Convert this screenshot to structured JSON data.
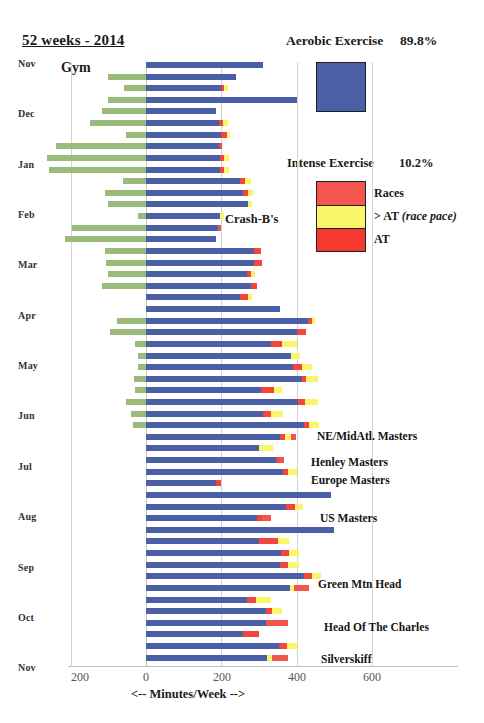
{
  "header": {
    "title": "52 weeks - 2014",
    "aerobic_label": "Aerobic Exercise",
    "aerobic_pct": "89.8%",
    "intense_label": "Intense Exercise",
    "intense_pct": "10.2%",
    "gym_label": "Gym",
    "crashb_label": "Crash-B's"
  },
  "legend": {
    "aerobic_swatch_color": "#4a5fa5",
    "items": [
      {
        "label": "Races",
        "color": "#f4554e"
      },
      {
        "label": "> AT (race pace)",
        "color": "#fbf56a"
      },
      {
        "label": "AT",
        "color": "#f4392e"
      }
    ]
  },
  "axis": {
    "x_title": "<--  Minutes/Week -->",
    "ticks": [
      "200",
      "0",
      "200",
      "400",
      "600"
    ],
    "tick_x_px": [
      80,
      146,
      222,
      297,
      372
    ],
    "months": [
      "Nov",
      "Dec",
      "Jan",
      "Feb",
      "Mar",
      "Apr",
      "May",
      "Jun",
      "Jul",
      "Aug",
      "Sep",
      "Oct",
      "Nov"
    ]
  },
  "annotations": [
    {
      "label": "NE/MidAtl. Masters",
      "top": 430,
      "left": 317
    },
    {
      "label": "Henley Masters",
      "top": 456,
      "left": 311
    },
    {
      "label": "Europe Masters",
      "top": 474,
      "left": 311
    },
    {
      "label": "US Masters",
      "top": 512,
      "left": 320
    },
    {
      "label": "Green Mtn Head",
      "top": 578,
      "left": 318
    },
    {
      "label": "Head Of The Charles",
      "top": 621,
      "left": 324
    },
    {
      "label": "Silverskiff",
      "top": 653,
      "left": 321
    }
  ],
  "chart_data": {
    "type": "bar",
    "title": "52 weeks - 2014",
    "xlabel": "<--  Minutes/Week -->",
    "ylabel": "",
    "xlim": [
      -260,
      620
    ],
    "grid": true,
    "orientation": "horizontal",
    "stacked": true,
    "legend_position": "right",
    "series_names": [
      "Gym",
      "Aerobic",
      "AT",
      "> AT (race pace)",
      "Races"
    ],
    "series_colors": [
      "#9bbb7b",
      "#4a5fa5",
      "#f4453a",
      "#fbf56a",
      "#f2554b"
    ],
    "categories": [
      "Week 1",
      "Week 2",
      "Week 3",
      "Week 4",
      "Week 5",
      "Week 6",
      "Week 7",
      "Week 8",
      "Week 9",
      "Week 10",
      "Week 11",
      "Week 12",
      "Week 13",
      "Week 14",
      "Week 15",
      "Week 16",
      "Week 17",
      "Week 18",
      "Week 19",
      "Week 20",
      "Week 21",
      "Week 22",
      "Week 23",
      "Week 24",
      "Week 25",
      "Week 26",
      "Week 27",
      "Week 28",
      "Week 29",
      "Week 30",
      "Week 31",
      "Week 32",
      "Week 33",
      "Week 34",
      "Week 35",
      "Week 36",
      "Week 37",
      "Week 38",
      "Week 39",
      "Week 40",
      "Week 41",
      "Week 42",
      "Week 43",
      "Week 44",
      "Week 45",
      "Week 46",
      "Week 47",
      "Week 48",
      "Week 49",
      "Week 50",
      "Week 51",
      "Week 52"
    ],
    "rows": [
      {
        "gym": 0,
        "aerobic": 310,
        "at": 0,
        "over": 0,
        "race": 0
      },
      {
        "gym": 100,
        "aerobic": 238,
        "at": 0,
        "over": 0,
        "race": 0
      },
      {
        "gym": 58,
        "aerobic": 198,
        "at": 8,
        "over": 12,
        "race": 0
      },
      {
        "gym": 102,
        "aerobic": 400,
        "at": 0,
        "over": 0,
        "race": 0
      },
      {
        "gym": 118,
        "aerobic": 185,
        "at": 0,
        "over": 0,
        "race": 0
      },
      {
        "gym": 150,
        "aerobic": 195,
        "at": 10,
        "over": 14,
        "race": 0
      },
      {
        "gym": 52,
        "aerobic": 200,
        "at": 14,
        "over": 10,
        "race": 0
      },
      {
        "gym": 240,
        "aerobic": 193,
        "at": 8,
        "over": 0,
        "race": 0
      },
      {
        "gym": 262,
        "aerobic": 196,
        "at": 10,
        "over": 14,
        "race": 0
      },
      {
        "gym": 258,
        "aerobic": 196,
        "at": 12,
        "over": 12,
        "race": 0
      },
      {
        "gym": 60,
        "aerobic": 250,
        "at": 14,
        "over": 14,
        "race": 0
      },
      {
        "gym": 108,
        "aerobic": 258,
        "at": 14,
        "over": 12,
        "race": 0
      },
      {
        "gym": 100,
        "aerobic": 272,
        "at": 0,
        "over": 10,
        "race": 0
      },
      {
        "gym": 22,
        "aerobic": 196,
        "at": 0,
        "over": 12,
        "race": 0
      },
      {
        "gym": 196,
        "aerobic": 190,
        "at": 0,
        "over": 0,
        "race": 8
      },
      {
        "gym": 215,
        "aerobic": 185,
        "at": 0,
        "over": 0,
        "race": 0
      },
      {
        "gym": 110,
        "aerobic": 288,
        "at": 18,
        "over": 0,
        "race": 0
      },
      {
        "gym": 105,
        "aerobic": 288,
        "at": 20,
        "over": 0,
        "race": 0
      },
      {
        "gym": 100,
        "aerobic": 268,
        "at": 12,
        "over": 10,
        "race": 0
      },
      {
        "gym": 118,
        "aerobic": 278,
        "at": 16,
        "over": 0,
        "race": 0
      },
      {
        "gym": 0,
        "aerobic": 250,
        "at": 20,
        "over": 12,
        "race": 0
      },
      {
        "gym": 0,
        "aerobic": 356,
        "at": 0,
        "over": 0,
        "race": 0
      },
      {
        "gym": 78,
        "aerobic": 430,
        "at": 10,
        "over": 10,
        "race": 0
      },
      {
        "gym": 96,
        "aerobic": 402,
        "at": 24,
        "over": 0,
        "race": 0
      },
      {
        "gym": 28,
        "aerobic": 332,
        "at": 30,
        "over": 38,
        "race": 0
      },
      {
        "gym": 22,
        "aerobic": 386,
        "at": 0,
        "over": 22,
        "race": 0
      },
      {
        "gym": 20,
        "aerobic": 390,
        "at": 24,
        "over": 28,
        "race": 0
      },
      {
        "gym": 32,
        "aerobic": 414,
        "at": 12,
        "over": 30,
        "race": 0
      },
      {
        "gym": 28,
        "aerobic": 306,
        "at": 34,
        "over": 20,
        "race": 0
      },
      {
        "gym": 52,
        "aerobic": 404,
        "at": 18,
        "over": 34,
        "race": 0
      },
      {
        "gym": 40,
        "aerobic": 310,
        "at": 22,
        "over": 32,
        "race": 0
      },
      {
        "gym": 35,
        "aerobic": 420,
        "at": 12,
        "over": 28,
        "race": 0
      },
      {
        "gym": 0,
        "aerobic": 356,
        "at": 14,
        "over": 16,
        "race": 12
      },
      {
        "gym": 0,
        "aerobic": 300,
        "at": 0,
        "over": 38,
        "race": 0
      },
      {
        "gym": 0,
        "aerobic": 346,
        "at": 8,
        "over": 0,
        "race": 12
      },
      {
        "gym": 0,
        "aerobic": 364,
        "at": 14,
        "over": 24,
        "race": 0
      },
      {
        "gym": 0,
        "aerobic": 186,
        "at": 14,
        "over": 0,
        "race": 0
      },
      {
        "gym": 0,
        "aerobic": 490,
        "at": 0,
        "over": 0,
        "race": 0
      },
      {
        "gym": 0,
        "aerobic": 372,
        "at": 24,
        "over": 22,
        "race": 0
      },
      {
        "gym": 0,
        "aerobic": 295,
        "at": 14,
        "over": 0,
        "race": 22
      },
      {
        "gym": 0,
        "aerobic": 498,
        "at": 0,
        "over": 0,
        "race": 0
      },
      {
        "gym": 0,
        "aerobic": 300,
        "at": 50,
        "over": 30,
        "race": 0
      },
      {
        "gym": 0,
        "aerobic": 358,
        "at": 22,
        "over": 26,
        "race": 0
      },
      {
        "gym": 0,
        "aerobic": 356,
        "at": 22,
        "over": 28,
        "race": 0
      },
      {
        "gym": 0,
        "aerobic": 420,
        "at": 20,
        "over": 24,
        "race": 0
      },
      {
        "gym": 0,
        "aerobic": 382,
        "at": 0,
        "over": 10,
        "race": 40
      },
      {
        "gym": 0,
        "aerobic": 268,
        "at": 24,
        "over": 40,
        "race": 0
      },
      {
        "gym": 0,
        "aerobic": 318,
        "at": 16,
        "over": 26,
        "race": 0
      },
      {
        "gym": 0,
        "aerobic": 318,
        "at": 0,
        "over": 0,
        "race": 60
      },
      {
        "gym": 0,
        "aerobic": 258,
        "at": 42,
        "over": 0,
        "race": 0
      },
      {
        "gym": 0,
        "aerobic": 352,
        "at": 22,
        "over": 26,
        "race": 0
      },
      {
        "gym": 0,
        "aerobic": 322,
        "at": 0,
        "over": 12,
        "race": 42
      }
    ]
  }
}
